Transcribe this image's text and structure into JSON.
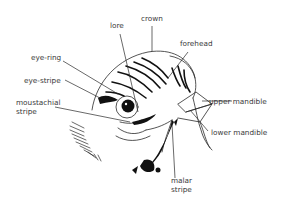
{
  "diagram": {
    "colors": {
      "line": "#2a2a2a",
      "text": "#3a3a3a",
      "background": "#ffffff"
    },
    "labels": {
      "lore": "lore",
      "crown": "crown",
      "forehead": "forehead",
      "eye_ring": "eye-ring",
      "eye_stripe": "eye-stripe",
      "moustachial_line1": "moustachial",
      "moustachial_line2": "stripe",
      "upper_mandible": "upper mandible",
      "lower_mandible": "lower mandible",
      "malar_line1": "malar",
      "malar_line2": "stripe"
    }
  }
}
